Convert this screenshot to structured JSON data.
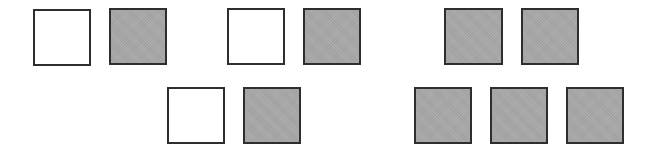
{
  "colors": {
    "gray_fill": "#a9a9a9",
    "white_fill": "#ffffff",
    "border": "#2e2e2e"
  },
  "squares": [
    {
      "id": "r1-1",
      "fill": "white",
      "x": 33,
      "y": 9,
      "w": 58,
      "h": 57
    },
    {
      "id": "r1-2",
      "fill": "gray",
      "x": 109,
      "y": 8,
      "w": 58,
      "h": 57
    },
    {
      "id": "r1-3",
      "fill": "white",
      "x": 227,
      "y": 8,
      "w": 58,
      "h": 57
    },
    {
      "id": "r1-4",
      "fill": "gray",
      "x": 303,
      "y": 8,
      "w": 58,
      "h": 57
    },
    {
      "id": "r1-5",
      "fill": "gray",
      "x": 444,
      "y": 8,
      "w": 59,
      "h": 57
    },
    {
      "id": "r1-6",
      "fill": "gray",
      "x": 521,
      "y": 8,
      "w": 58,
      "h": 57
    },
    {
      "id": "r2-1",
      "fill": "white",
      "x": 167,
      "y": 87,
      "w": 58,
      "h": 57
    },
    {
      "id": "r2-2",
      "fill": "gray",
      "x": 243,
      "y": 87,
      "w": 58,
      "h": 57
    },
    {
      "id": "r2-3",
      "fill": "gray",
      "x": 414,
      "y": 87,
      "w": 58,
      "h": 57
    },
    {
      "id": "r2-4",
      "fill": "gray",
      "x": 490,
      "y": 87,
      "w": 58,
      "h": 57
    },
    {
      "id": "r2-5",
      "fill": "gray",
      "x": 566,
      "y": 87,
      "w": 58,
      "h": 57
    }
  ]
}
